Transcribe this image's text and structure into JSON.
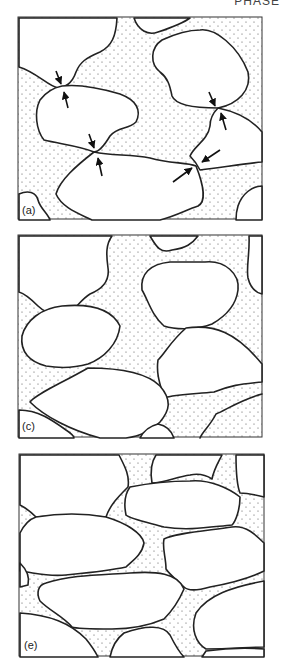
{
  "header": {
    "clipped_text": "PHASE"
  },
  "figure": {
    "panels": [
      {
        "id": "a",
        "label": "(a)",
        "description": "Grains in pore fluid with contact-point pressure arrows"
      },
      {
        "id": "c",
        "label": "(c)",
        "description": "Grains after compaction with enlarged contacts"
      },
      {
        "id": "e",
        "label": "(e)",
        "description": "Grains with sutured (stylolitic) contacts"
      }
    ],
    "colors": {
      "grain_fill": "#ffffff",
      "outline": "#222222",
      "pore_dots": "#555555"
    }
  }
}
